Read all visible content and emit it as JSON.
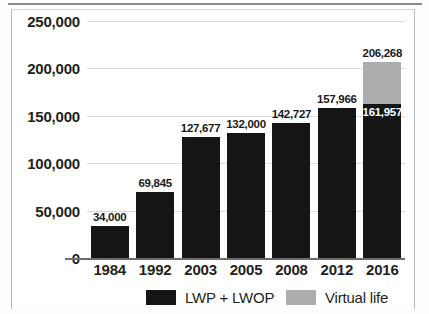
{
  "chart_data": {
    "type": "bar",
    "stacked": true,
    "title": "",
    "xlabel": "",
    "ylabel": "",
    "categories": [
      "1984",
      "1992",
      "2003",
      "2005",
      "2008",
      "2012",
      "2016"
    ],
    "series": [
      {
        "name": "LWP + LWOP",
        "color": "#151515",
        "values": [
          34000,
          69845,
          127677,
          132000,
          142727,
          157966,
          161957
        ],
        "value_labels": [
          "34,000",
          "69,845",
          "127,677",
          "132,000",
          "142,727",
          "157,966",
          "161,957"
        ]
      },
      {
        "name": "Virtual life",
        "color": "#adadad",
        "values": [
          0,
          0,
          0,
          0,
          0,
          0,
          44311
        ],
        "total_labels": [
          "",
          "",
          "",
          "",
          "",
          "",
          "206,268"
        ]
      }
    ],
    "ylim": [
      0,
      250000
    ],
    "yticks": [
      0,
      50000,
      100000,
      150000,
      200000,
      250000
    ],
    "ytick_labels": [
      "0",
      "50,000",
      "100,000",
      "150,000",
      "200,000",
      "250,000"
    ],
    "grid": true,
    "legend_position": "bottom",
    "legend": [
      {
        "label": "LWP + LWOP",
        "color": "#151515"
      },
      {
        "label": "Virtual life",
        "color": "#adadad"
      }
    ]
  }
}
